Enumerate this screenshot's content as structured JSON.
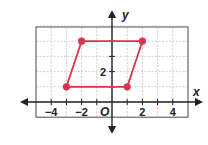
{
  "chart_data": {
    "type": "scatter",
    "title": "",
    "xlabel": "x",
    "ylabel": "y",
    "xlim": [
      -5,
      5
    ],
    "ylim": [
      -1,
      5
    ],
    "grid": true,
    "x_ticks": [
      -4,
      -2,
      2,
      4
    ],
    "x_tick_labels": [
      "−4",
      "−2",
      "2",
      "4"
    ],
    "y_ticks": [
      2
    ],
    "y_tick_labels": [
      "2"
    ],
    "origin_label": "O",
    "polygon": {
      "name": "parallelogram",
      "vertices": [
        [
          -3,
          1
        ],
        [
          1,
          1
        ],
        [
          2,
          4
        ],
        [
          -2,
          4
        ]
      ],
      "color": "#d9344f"
    }
  }
}
